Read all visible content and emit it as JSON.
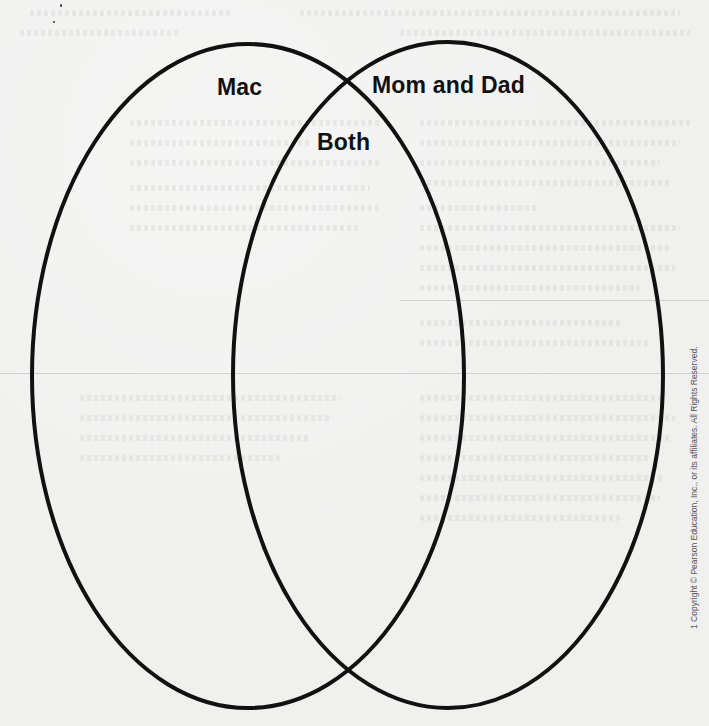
{
  "diagram": {
    "type": "venn",
    "circles": [
      {
        "label": "Mac",
        "cx": 248,
        "cy": 376,
        "rx": 216,
        "ry": 332
      },
      {
        "label": "Mom and Dad",
        "cx": 448,
        "cy": 375,
        "rx": 215,
        "ry": 333
      }
    ],
    "overlap_label": "Both",
    "stroke_color": "#111111",
    "background_color": "#f0f0ef"
  },
  "labels": {
    "left": "Mac",
    "right": "Mom and Dad",
    "overlap": "Both"
  },
  "footer": {
    "copyright": "1 Copyright © Pearson Education, Inc., or its affiliates. All Rights Reserved."
  }
}
